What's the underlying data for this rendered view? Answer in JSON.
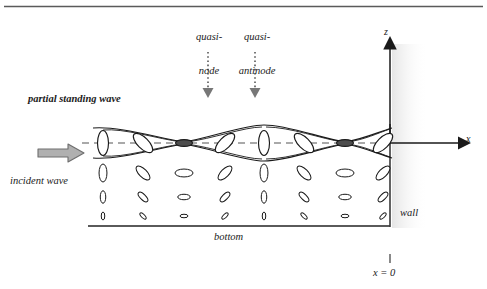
{
  "figure": {
    "title_rule": true,
    "labels": {
      "quasi_node_line1": "quasi-",
      "quasi_node_line2": "node",
      "quasi_antinode_line1": "quasi-",
      "quasi_antinode_line2": "antinode",
      "partial_standing_wave": "partial standing wave",
      "incident_wave": "incident wave",
      "bottom": "bottom",
      "wall": "wall",
      "axis_z": "z",
      "axis_x": "x",
      "x_origin": "x = 0"
    },
    "colors": {
      "ink": "#1a1a1a",
      "line": "#222222",
      "gray_arrow_fill": "#b0b0b0",
      "gray_arrow_stroke": "#6e6e6e",
      "gray_rule": "#5a5a5a",
      "dotted_arrow": "#777777",
      "node_fill": "#555555",
      "shade": "#ededed"
    },
    "geometry": {
      "axis_y": 143,
      "wall_x": 390,
      "bottom_y": 226,
      "left_x": 88,
      "z_top": 40,
      "x_right": 466
    },
    "columns": [
      {
        "x": 103,
        "kind": "antinode",
        "angle": 90
      },
      {
        "x": 143,
        "kind": "intermediate",
        "angle": 135
      },
      {
        "x": 184,
        "kind": "node",
        "angle": 0
      },
      {
        "x": 225,
        "kind": "intermediate",
        "angle": 45
      },
      {
        "x": 264,
        "kind": "antinode",
        "angle": 90
      },
      {
        "x": 304,
        "kind": "intermediate",
        "angle": 135
      },
      {
        "x": 345,
        "kind": "node",
        "angle": 0
      },
      {
        "x": 383,
        "kind": "intermediate",
        "angle": 45
      }
    ],
    "rows": [
      {
        "y": 143,
        "scale": 1.0,
        "in_envelope": true
      },
      {
        "y": 173,
        "scale": 0.72,
        "in_envelope": false
      },
      {
        "y": 197,
        "scale": 0.5,
        "in_envelope": false
      },
      {
        "y": 216,
        "scale": 0.32,
        "in_envelope": false
      }
    ],
    "ellipse_base": {
      "rx": 5.5,
      "ry": 12.5
    },
    "pointers": [
      {
        "name": "quasi-node-pointer",
        "x": 208,
        "y_top": 52,
        "y_bottom": 98
      },
      {
        "name": "quasi-antinode-pointer",
        "x": 255,
        "y_top": 52,
        "y_bottom": 98
      }
    ]
  },
  "chart_data": {
    "type": "diagram",
    "axes": {
      "x_label": "x",
      "z_label": "z",
      "origin_label": "x = 0"
    },
    "annotations": [
      "quasi-node",
      "quasi-antinode",
      "partial standing wave",
      "incident wave",
      "bottom",
      "wall"
    ],
    "ellipse_orientation_cycle_deg": [
      90,
      135,
      0,
      45
    ],
    "depth_rows": 4,
    "columns_count": 8
  }
}
